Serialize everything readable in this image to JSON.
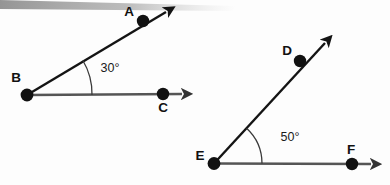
{
  "figure": {
    "kind": "geometry-angle-diagram",
    "background_color": "#fdfdfd",
    "width": 390,
    "height": 185,
    "artifact": {
      "name": "scan-shadow-band",
      "color": "#9a9a9a",
      "description": "diagonal gray scan shadow strip across the top-left edge"
    }
  },
  "diagrams": [
    {
      "id": "angle-abc",
      "name": "Angle ABC",
      "vertex": "B",
      "angle_value": "30°",
      "angle_degrees": 30,
      "ray_color_slanted": "#141414",
      "ray_color_horizontal": "#555555",
      "arc_color": "#3a3a3a",
      "points": [
        {
          "label": "A",
          "x": 143,
          "y": 21,
          "label_x": 129,
          "label_y": 16
        },
        {
          "label": "B",
          "x": 27,
          "y": 95,
          "label_x": 16,
          "label_y": 82
        },
        {
          "label": "C",
          "x": 163,
          "y": 94,
          "label_x": 163,
          "label_y": 112
        }
      ],
      "arc": {
        "radius": 65,
        "cx": 27,
        "cy": 95
      },
      "angle_label_x": 110,
      "angle_label_y": 72,
      "arrow_a_tip": {
        "x": 170,
        "y": 10
      },
      "arrow_c_tip": {
        "x": 186,
        "y": 94
      }
    },
    {
      "id": "angle-def",
      "name": "Angle DEF",
      "vertex": "E",
      "angle_value": "50°",
      "angle_degrees": 50,
      "ray_color_slanted": "#141414",
      "ray_color_horizontal": "#555555",
      "arc_color": "#3a3a3a",
      "points": [
        {
          "label": "D",
          "x": 300,
          "y": 61,
          "label_x": 287,
          "label_y": 55
        },
        {
          "label": "E",
          "x": 214,
          "y": 163,
          "label_x": 200,
          "label_y": 160
        },
        {
          "label": "F",
          "x": 352,
          "y": 164,
          "label_x": 351,
          "label_y": 154
        }
      ],
      "arc": {
        "radius": 48,
        "cx": 214,
        "cy": 163
      },
      "angle_label_x": 290,
      "angle_label_y": 141,
      "arrow_d_tip": {
        "x": 329,
        "y": 39
      },
      "arrow_f_tip": {
        "x": 375,
        "y": 164
      }
    }
  ]
}
